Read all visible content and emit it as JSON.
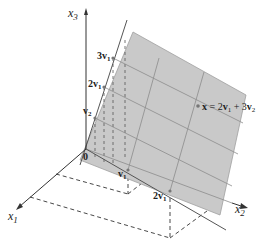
{
  "figure": {
    "axes": {
      "x1": {
        "label": "x",
        "sub": "1"
      },
      "x2": {
        "label": "x",
        "sub": "2"
      },
      "x3": {
        "label": "x",
        "sub": "3"
      }
    },
    "origin_label": "0",
    "points": {
      "v1": {
        "label": "v",
        "sub": "1"
      },
      "two_v1": {
        "label": "2v",
        "sub": "1"
      },
      "v2": {
        "label": "v",
        "sub": "2"
      },
      "two_v2": {
        "label": "2v",
        "sub": "1"
      },
      "three_v2": {
        "label": "3v",
        "sub": "1"
      }
    },
    "equation": {
      "x": "x",
      "eq": " = 2",
      "v1": "v",
      "v1_sub": "1",
      "plus": " + 3",
      "v2": "v",
      "v2_sub": "2"
    },
    "colors": {
      "plane_fill": "#c8c8c8",
      "plane_stroke": "#9a9a9a",
      "grid_line": "#8a8a8a",
      "axis": "#333333",
      "dashed": "#333333"
    }
  }
}
